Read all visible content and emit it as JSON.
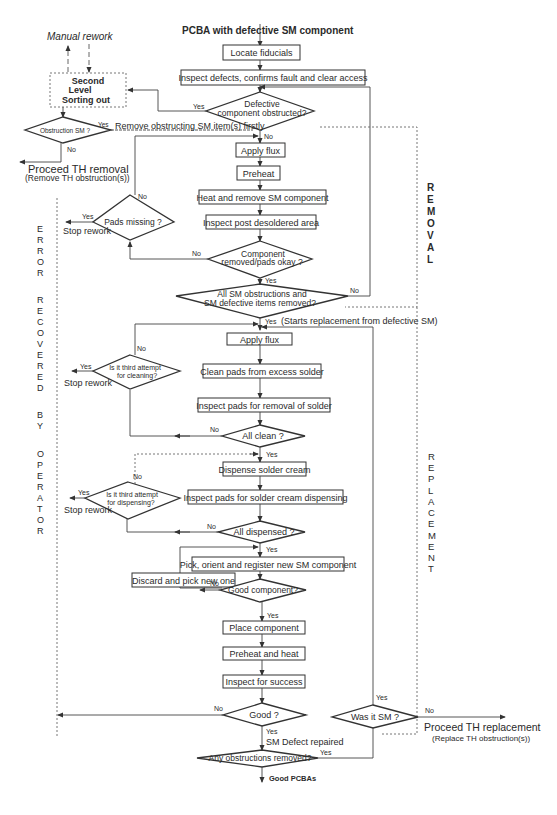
{
  "start_label": "PCBA with defective SM component",
  "end_label": "Good PCBAs",
  "manual_rework": "Manual rework",
  "second_level": [
    "Second",
    "Level",
    "Sorting out"
  ],
  "remove_obstructing": "Remove obstructing SM  item(s) firstly",
  "proceed_th_removal": "Proceed TH removal",
  "proceed_th_removal_sub": "(Remove TH obstruction(s))",
  "proceed_th_replacement": "Proceed TH replacement",
  "proceed_th_replacement_sub": "(Replace TH obstruction(s))",
  "starts_replacement": "(Starts replacement  from defective SM)",
  "sm_defect_repaired": "SM Defect repaired",
  "stop_rework": "Stop rework",
  "yes": "Yes",
  "no": "No",
  "side_labels": {
    "removal": [
      "R",
      "E",
      "M",
      "O",
      "V",
      "A",
      "L"
    ],
    "replacement": [
      "R",
      "E",
      "P",
      "L",
      "A",
      "C",
      "E",
      "M",
      "E",
      "N",
      "T"
    ],
    "error": [
      "E",
      "R",
      "R",
      "O",
      "R"
    ],
    "recovered": [
      "R",
      "E",
      "C",
      "O",
      "V",
      "E",
      "R",
      "E",
      "D"
    ],
    "by": [
      "B",
      "Y"
    ],
    "operator": [
      "O",
      "P",
      "E",
      "R",
      "A",
      "T",
      "O",
      "R"
    ]
  },
  "process_boxes": {
    "locate_fiducials": "Locate fiducials",
    "inspect_defects": "Inspect defects, confirms fault and clear access",
    "apply_flux_1": "Apply flux",
    "preheat": "Preheat",
    "heat_remove": "Heat and remove SM component",
    "inspect_post": "Inspect post desoldered area",
    "apply_flux_2": "Apply flux",
    "clean_pads": "Clean pads from excess solder",
    "inspect_pads_removal": "Inspect pads for removal of solder",
    "dispense_cream": "Dispense solder cream",
    "inspect_pads_cream": "Inspect pads for solder cream dispensing",
    "pick_orient": "Pick, orient and register new SM  component",
    "discard_pick": "Discard and pick new one",
    "place_component": "Place component",
    "preheat_heat": "Preheat and heat",
    "inspect_success": "Inspect for success"
  },
  "decisions": {
    "defective_obstructed": [
      "Defective",
      "component obstructed?"
    ],
    "obstruction_sm": [
      "Obstruction SM ?"
    ],
    "pads_missing": [
      "Pads missing ?"
    ],
    "component_removed": [
      "Component",
      "removed/pads okay ?"
    ],
    "all_sm_obstructions": [
      "All SM obstructions and",
      "SM defective items removed?"
    ],
    "third_attempt_cleaning": [
      "Is it third attempt",
      "for cleaning?"
    ],
    "all_clean": [
      "All clean ?"
    ],
    "third_attempt_dispensing": [
      "Is it third attempt",
      "for dispensing?"
    ],
    "all_dispensed": [
      "All dispensed ?"
    ],
    "good_component": [
      "Good component?"
    ],
    "good": [
      "Good ?"
    ],
    "was_it_sm": [
      "Was it SM ?"
    ],
    "any_obstructions": [
      "Any obstructions removed?"
    ]
  }
}
